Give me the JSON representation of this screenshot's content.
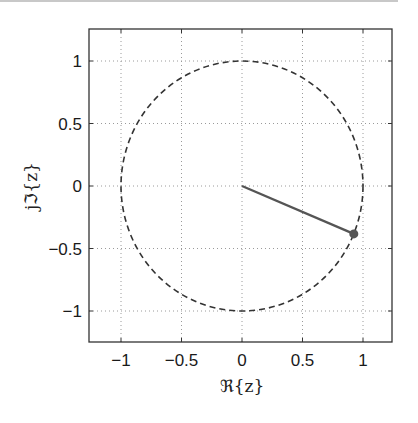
{
  "chart_data": {
    "type": "line",
    "title": "",
    "xlabel": "ℜ{z}",
    "ylabel": "jℑ{z}",
    "xlim": [
      -1.25,
      1.25
    ],
    "ylim": [
      -1.25,
      1.25
    ],
    "grid": true,
    "legend": null,
    "x_ticks": [
      -1,
      -0.5,
      0,
      0.5,
      1
    ],
    "y_ticks": [
      -1,
      -0.5,
      0,
      0.5,
      1
    ],
    "x_tick_labels": [
      "−1",
      "−0.5",
      "0",
      "0.5",
      "1"
    ],
    "y_tick_labels": [
      "−1",
      "−0.5",
      "0",
      "0.5",
      "1"
    ],
    "series": [
      {
        "name": "unit-circle",
        "style": "dashed",
        "color": "#333333",
        "description": "Unit circle |z| = 1",
        "center": [
          0,
          0
        ],
        "radius": 1
      },
      {
        "name": "phasor",
        "style": "solid",
        "color": "#555555",
        "x": [
          0,
          0.924
        ],
        "y": [
          0,
          -0.383
        ]
      },
      {
        "name": "phasor-tip",
        "style": "marker",
        "color": "#555555",
        "x": [
          0.924
        ],
        "y": [
          -0.383
        ]
      }
    ]
  },
  "axes": {
    "xlabel": "ℜ{z}",
    "ylabel": "jℑ{z}"
  }
}
